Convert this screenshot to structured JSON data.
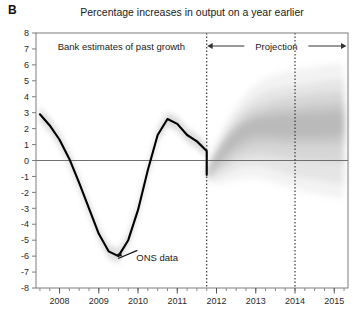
{
  "panel": {
    "label": "B"
  },
  "title": "Percentage increases in output on a year earlier",
  "annotations": {
    "past": "Bank estimates of past growth",
    "projection": "Projection",
    "ons": "ONS data"
  },
  "colors": {
    "line": "#000000",
    "fan_dark": "#9a9a9a",
    "fan_light": "#e8e8e8",
    "frame": "#7c7c7c",
    "zero_line": "#6f6f6f",
    "text": "#1a1a1a"
  },
  "chart_data": {
    "type": "area",
    "title": "Percentage increases in output on a year earlier",
    "subtitle": "",
    "xlabel": "",
    "ylabel": "",
    "xlim": [
      2007.4,
      2015.35
    ],
    "ylim": [
      -8,
      8
    ],
    "yticks": [
      8,
      7,
      6,
      5,
      4,
      3,
      2,
      1,
      0,
      -1,
      -2,
      -3,
      -4,
      -5,
      -6,
      -7,
      -8
    ],
    "ytick_labels": [
      "8",
      "7",
      "6",
      "5",
      "4",
      "3",
      "2",
      "1",
      "0",
      "-1",
      "-2",
      "-3",
      "-4",
      "-5",
      "-6",
      "-7",
      "-8"
    ],
    "xticks": [
      2008,
      2009,
      2010,
      2011,
      2012,
      2013,
      2014,
      2015
    ],
    "xtick_labels": [
      "2008",
      "2009",
      "2010",
      "2011",
      "2012",
      "2013",
      "2014",
      "2015"
    ],
    "x_minor_interval_years": 0.25,
    "grid": false,
    "zero_line": 0,
    "projection_start": 2011.75,
    "vertical_markers": [
      2011.75,
      2014.0
    ],
    "legend": "none",
    "series": [
      {
        "name": "ONS data",
        "type": "line",
        "x": [
          2007.5,
          2007.75,
          2008.0,
          2008.25,
          2008.5,
          2008.75,
          2009.0,
          2009.25,
          2009.5,
          2009.75,
          2010.0,
          2010.25,
          2010.5,
          2010.75,
          2011.0,
          2011.25,
          2011.5,
          2011.75
        ],
        "values": [
          2.9,
          2.2,
          1.3,
          0.1,
          -1.4,
          -3.0,
          -4.6,
          -5.7,
          -6.0,
          -5.0,
          -3.1,
          -0.6,
          1.6,
          2.6,
          2.3,
          1.6,
          1.2,
          0.6
        ]
      },
      {
        "name": "ONS data tail",
        "type": "line",
        "x": [
          2011.25,
          2011.5,
          2011.75
        ],
        "values": [
          0.6,
          0.5,
          -0.9
        ]
      },
      {
        "name": "Projection central tendency",
        "type": "band_center",
        "x": [
          2011.75,
          2012.0,
          2012.25,
          2012.5,
          2012.75,
          2013.0,
          2013.25,
          2013.5,
          2013.75,
          2014.0,
          2014.25,
          2014.5,
          2014.75,
          2015.0,
          2015.25
        ],
        "values": [
          -0.9,
          0.1,
          0.9,
          1.6,
          2.0,
          2.2,
          2.2,
          2.1,
          2.0,
          2.0,
          2.1,
          2.2,
          2.3,
          2.4,
          2.5
        ]
      }
    ],
    "fan_bands": [
      {
        "name": "outer",
        "opacity": 0.12,
        "upper": [
          -0.5,
          1.1,
          2.4,
          3.4,
          4.2,
          4.8,
          5.2,
          5.4,
          5.6,
          5.7,
          5.8,
          5.9,
          6.0,
          6.1,
          6.1
        ],
        "lower": [
          -1.3,
          -1.5,
          -1.4,
          -1.2,
          -1.1,
          -1.1,
          -1.2,
          -1.4,
          -1.6,
          -1.8,
          -2.0,
          -2.1,
          -2.2,
          -2.3,
          -2.4
        ]
      },
      {
        "name": "mid-outer",
        "opacity": 0.16,
        "upper": [
          -0.6,
          0.8,
          1.9,
          2.8,
          3.5,
          4.0,
          4.3,
          4.5,
          4.6,
          4.7,
          4.8,
          4.9,
          5.0,
          5.1,
          5.1
        ],
        "lower": [
          -1.2,
          -1.1,
          -0.8,
          -0.5,
          -0.3,
          -0.3,
          -0.4,
          -0.6,
          -0.8,
          -1.0,
          -1.1,
          -1.2,
          -1.3,
          -1.4,
          -1.5
        ]
      },
      {
        "name": "mid",
        "opacity": 0.2,
        "upper": [
          -0.7,
          0.6,
          1.6,
          2.4,
          3.0,
          3.4,
          3.6,
          3.8,
          3.9,
          4.0,
          4.1,
          4.2,
          4.2,
          4.3,
          4.3
        ],
        "lower": [
          -1.1,
          -0.7,
          -0.3,
          0.1,
          0.3,
          0.4,
          0.4,
          0.3,
          0.2,
          0.1,
          0.0,
          0.0,
          -0.1,
          -0.1,
          -0.2
        ]
      },
      {
        "name": "mid-inner",
        "opacity": 0.24,
        "upper": [
          -0.75,
          0.45,
          1.4,
          2.1,
          2.6,
          2.9,
          3.1,
          3.2,
          3.3,
          3.3,
          3.4,
          3.5,
          3.5,
          3.6,
          3.6
        ],
        "lower": [
          -1.05,
          -0.45,
          0.1,
          0.6,
          0.9,
          1.1,
          1.1,
          1.1,
          1.0,
          1.0,
          1.0,
          1.0,
          1.0,
          1.0,
          1.0
        ]
      },
      {
        "name": "inner",
        "opacity": 0.3,
        "upper": [
          -0.8,
          0.35,
          1.25,
          1.95,
          2.35,
          2.6,
          2.75,
          2.8,
          2.85,
          2.85,
          2.9,
          2.95,
          3.0,
          3.05,
          3.1
        ],
        "lower": [
          -1.0,
          -0.2,
          0.45,
          1.0,
          1.4,
          1.6,
          1.6,
          1.55,
          1.5,
          1.5,
          1.5,
          1.5,
          1.5,
          1.55,
          1.6
        ]
      }
    ],
    "history_fan": {
      "opacity": 0.3,
      "half_width": 0.45
    },
    "annotation_points": [
      {
        "label": "ONS data",
        "x": 2009.6,
        "y": -5.2,
        "arrow_to_x": 2009.25,
        "arrow_to_y": -5.9
      }
    ]
  }
}
